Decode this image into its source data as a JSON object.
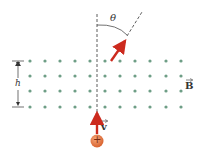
{
  "labels": {
    "theta": "θ",
    "h": "h",
    "B": "B",
    "v": "v",
    "charge": "+"
  },
  "colors": {
    "dots": "#6e9e86",
    "arrow": "#cc2a1e",
    "charge": "#e07a4a",
    "lines": "#333333"
  },
  "field": {
    "rows_y": [
      61,
      76,
      91,
      107
    ],
    "cols_x": [
      30,
      45,
      60,
      75,
      90,
      105,
      120,
      135,
      150,
      166,
      181
    ]
  }
}
